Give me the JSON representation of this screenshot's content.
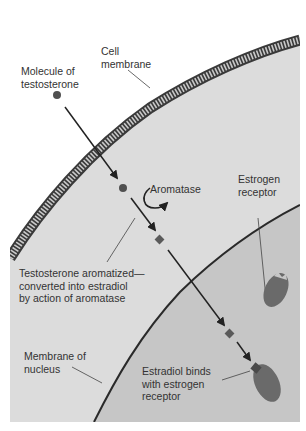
{
  "labels": {
    "cell_membrane": "Cell\nmembrane",
    "testosterone": "Molecule of\ntestosterone",
    "aromatase": "Aromatase",
    "estrogen_receptor": "Estrogen\nreceptor",
    "aromatized": "Testosterone aromatized—\nconverted into estradiol\nby action of aromatase",
    "nucleus_membrane": "Membrane of\nnucleus",
    "estradiol_binds": "Estradiol binds\nwith estrogen\nreceptor"
  },
  "colors": {
    "outside": "#ffffff",
    "cytoplasm": "#dcdcdc",
    "nucleus": "#c6c6c6",
    "membrane_dark": "#3a3a3a",
    "membrane_light": "#bdbdbd",
    "receptor": "#6a6a6a",
    "molecule": "#505050",
    "line": "#222222"
  }
}
